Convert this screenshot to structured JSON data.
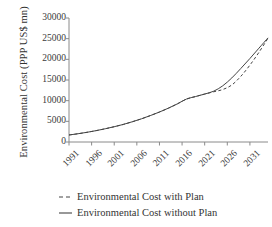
{
  "chart_data": {
    "type": "line",
    "title": "",
    "xlabel": "",
    "ylabel": "Environmental Cost (PPP US$ mn)",
    "xlim": [
      1991,
      2035
    ],
    "ylim": [
      0,
      30000
    ],
    "grid": false,
    "legend_position": "below",
    "xticks": [
      "1991",
      "1996",
      "2001",
      "2006",
      "2011",
      "2016",
      "2021",
      "2026",
      "2031"
    ],
    "xtick_values": [
      1991,
      1996,
      2001,
      2006,
      2011,
      2016,
      2021,
      2026,
      2031
    ],
    "yticks": [
      "0",
      "5000",
      "10000",
      "15000",
      "20000",
      "25000",
      "30000"
    ],
    "ytick_values": [
      0,
      5000,
      10000,
      15000,
      20000,
      25000,
      30000
    ],
    "x": [
      1991,
      1993,
      1995,
      1997,
      1999,
      2001,
      2003,
      2005,
      2007,
      2009,
      2011,
      2013,
      2015,
      2017,
      2019,
      2021,
      2023,
      2025,
      2027,
      2029,
      2031,
      2033,
      2035
    ],
    "series": [
      {
        "name": "Environmental Cost without Plan",
        "style": "solid",
        "color": "#444444",
        "values": [
          1700,
          2000,
          2350,
          2750,
          3200,
          3700,
          4250,
          4900,
          5600,
          6400,
          7250,
          8200,
          9250,
          10400,
          11000,
          11600,
          12300,
          13600,
          15500,
          17800,
          20200,
          22700,
          25200
        ]
      },
      {
        "name": "Environmental Cost with Plan",
        "style": "dashed",
        "color": "#444444",
        "values": [
          1700,
          2000,
          2350,
          2750,
          3200,
          3700,
          4250,
          4900,
          5600,
          6400,
          7250,
          8200,
          9250,
          10400,
          11000,
          11600,
          12150,
          12700,
          13800,
          15900,
          18600,
          21700,
          25100
        ]
      }
    ],
    "annotations": []
  },
  "legend": {
    "items": [
      {
        "label": "Environmental Cost with Plan",
        "marker": "dashed-line-marker"
      },
      {
        "label": "Environmental Cost without Plan",
        "marker": "solid-line-marker"
      }
    ]
  },
  "axes": {
    "y_title": "Environmental Cost (PPP US$ mn)"
  }
}
